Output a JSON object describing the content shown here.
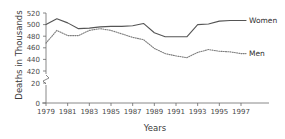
{
  "chart_data": {
    "type": "line",
    "title": "",
    "xlabel": "Years",
    "ylabel": "Deaths in Thousands",
    "x": [
      1979,
      1980,
      1981,
      1982,
      1983,
      1984,
      1985,
      1986,
      1987,
      1988,
      1989,
      1990,
      1991,
      1992,
      1993,
      1994,
      1995,
      1996,
      1997
    ],
    "xlim": [
      1979,
      1997
    ],
    "xticks": [
      1979,
      1981,
      1983,
      1985,
      1987,
      1989,
      1991,
      1993,
      1995,
      1997
    ],
    "xticklabels": [
      "1979",
      "1981",
      "1983",
      "1985",
      "1987",
      "1989",
      "1991",
      "1993",
      "1995",
      "1997"
    ],
    "ylim": [
      420,
      520
    ],
    "yticks": [
      0,
      20,
      420,
      440,
      460,
      480,
      500,
      520
    ],
    "yticklabels": [
      "0",
      "20",
      "420",
      "440",
      "460",
      "480",
      "500",
      "520"
    ],
    "axis_break": true,
    "axis_break_between": [
      20,
      420
    ],
    "grid": false,
    "legend_position": "right-inline",
    "series": [
      {
        "name": "Women",
        "style": "solid",
        "color": "#555555",
        "values": [
          500,
          510,
          503,
          493,
          494,
          496,
          497,
          497,
          498,
          502,
          486,
          479,
          479,
          479,
          500,
          501,
          506,
          507,
          507
        ]
      },
      {
        "name": "Men",
        "style": "dotted",
        "color": "#7d7d7d",
        "values": [
          468,
          490,
          481,
          481,
          490,
          493,
          490,
          484,
          478,
          474,
          459,
          450,
          446,
          443,
          452,
          457,
          454,
          453,
          450
        ]
      }
    ]
  },
  "labels": {
    "women": "Women",
    "men": "Men",
    "x_axis_title": "Years",
    "y_axis_title": "Deaths in Thousands"
  }
}
